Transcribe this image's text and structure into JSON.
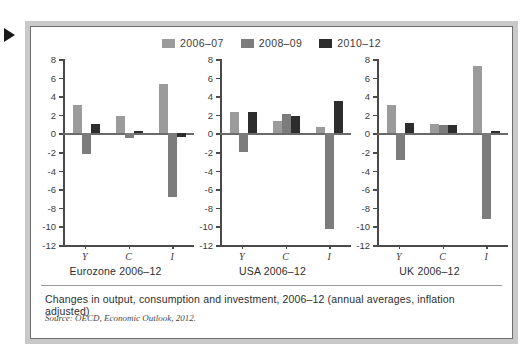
{
  "figure": {
    "marker_icon": "play-triangle-icon",
    "caption": "Changes in output, consumption and investment, 2006–12 (annual averages, inflation adjusted)",
    "source": "Source: OECD, Economic Outlook, 2012."
  },
  "legend": {
    "position": "top-center",
    "entries": [
      {
        "label": "2006–07",
        "color": "#9b9b9b"
      },
      {
        "label": "2008–09",
        "color": "#7c7c7c"
      },
      {
        "label": "2010–12",
        "color": "#2d2d2d"
      }
    ]
  },
  "chart_data": [
    {
      "type": "bar",
      "title": "Eurozone 2006–12",
      "xlabel": "",
      "ylabel": "",
      "categories": [
        "Y",
        "C",
        "I"
      ],
      "ylim": [
        -12,
        8
      ],
      "yticks": [
        8,
        6,
        4,
        2,
        0,
        -2,
        -4,
        -6,
        -8,
        -10,
        -12
      ],
      "grid": false,
      "series": [
        {
          "name": "2006–07",
          "color": "#9b9b9b",
          "values": [
            3.1,
            1.9,
            5.3
          ]
        },
        {
          "name": "2008–09",
          "color": "#7c7c7c",
          "values": [
            -2.2,
            -0.5,
            -6.8
          ]
        },
        {
          "name": "2010–12",
          "color": "#2d2d2d",
          "values": [
            1.05,
            0.3,
            -0.35
          ]
        }
      ]
    },
    {
      "type": "bar",
      "title": "USA 2006–12",
      "xlabel": "",
      "ylabel": "",
      "categories": [
        "Y",
        "C",
        "I"
      ],
      "ylim": [
        -12,
        8
      ],
      "yticks": [
        8,
        6,
        4,
        2,
        0,
        -2,
        -4,
        -6,
        -8,
        -10,
        -12
      ],
      "grid": false,
      "series": [
        {
          "name": "2006–07",
          "color": "#9b9b9b",
          "values": [
            2.3,
            1.3,
            0.65
          ]
        },
        {
          "name": "2008–09",
          "color": "#7c7c7c",
          "values": [
            -2.0,
            2.1,
            -10.3
          ]
        },
        {
          "name": "2010–12",
          "color": "#2d2d2d",
          "values": [
            2.35,
            1.85,
            3.5
          ]
        }
      ]
    },
    {
      "type": "bar",
      "title": "UK 2006–12",
      "xlabel": "",
      "ylabel": "",
      "categories": [
        "Y",
        "C",
        "I"
      ],
      "ylim": [
        -12,
        8
      ],
      "yticks": [
        8,
        6,
        4,
        2,
        0,
        -2,
        -4,
        -6,
        -8,
        -10,
        -12
      ],
      "grid": false,
      "series": [
        {
          "name": "2006–07",
          "color": "#9b9b9b",
          "values": [
            3.1,
            1.0,
            7.25
          ]
        },
        {
          "name": "2008–09",
          "color": "#7c7c7c",
          "values": [
            -2.9,
            0.85,
            -9.25
          ]
        },
        {
          "name": "2010–12",
          "color": "#2d2d2d",
          "values": [
            1.15,
            0.85,
            0.25
          ]
        }
      ]
    }
  ]
}
